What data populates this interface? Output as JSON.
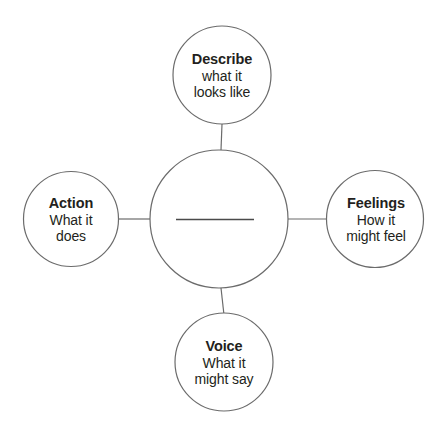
{
  "diagram": {
    "type": "concept-map",
    "background_color": "#ffffff",
    "stroke_color": "#6b6b6b",
    "text_color": "#231f20",
    "center": {
      "name": "center-node",
      "title": "",
      "fill_in_line": true
    },
    "nodes": [
      {
        "key": "describe",
        "position": "top",
        "title": "Describe",
        "lines": [
          "what it",
          "looks like"
        ]
      },
      {
        "key": "action",
        "position": "left",
        "title": "Action",
        "lines": [
          "What it",
          "does"
        ]
      },
      {
        "key": "feelings",
        "position": "right",
        "title": "Feelings",
        "lines": [
          "How it",
          "might feel"
        ]
      },
      {
        "key": "voice",
        "position": "bottom",
        "title": "Voice",
        "lines": [
          "What it",
          "might say"
        ]
      }
    ]
  }
}
